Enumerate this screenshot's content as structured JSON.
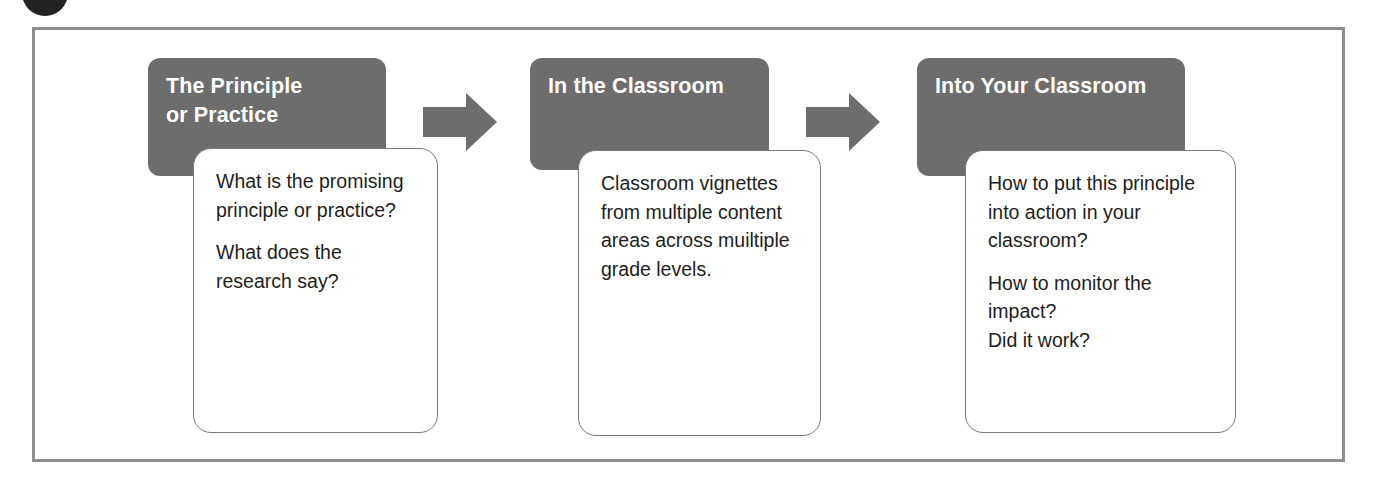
{
  "diagram": {
    "title_visible": false,
    "colors": {
      "header_fill": "#6d6d6d",
      "header_text": "#ffffff",
      "card_fill": "#ffffff",
      "card_border": "#77797b",
      "card_text": "#1e1e1e",
      "arrow_fill": "#6d6d6d",
      "frame_border": "#8e8e8e",
      "corner_dot": "#232323"
    },
    "steps": [
      {
        "header_lines": [
          "The Principle",
          "or Practice"
        ],
        "header_text": "The Principle or Practice",
        "card_paragraphs": [
          "What is the promising principle or practice?",
          "What does the research say?"
        ]
      },
      {
        "header_lines": [
          "In the Classroom"
        ],
        "header_text": "In the Classroom",
        "card_paragraphs": [
          "Classroom vignettes from multiple content areas across muiltiple grade levels."
        ]
      },
      {
        "header_lines": [
          "Into Your Classroom"
        ],
        "header_text": "Into Your Classroom",
        "card_paragraphs": [
          "How to put this principle into action in your classroom?",
          "How to monitor the impact?\nDid it work?"
        ]
      }
    ],
    "connectors": [
      {
        "icon": "right-arrow-icon",
        "from": "The Principle or Practice",
        "to": "In the Classroom"
      },
      {
        "icon": "right-arrow-icon",
        "from": "In the Classroom",
        "to": "Into Your Classroom"
      }
    ]
  }
}
